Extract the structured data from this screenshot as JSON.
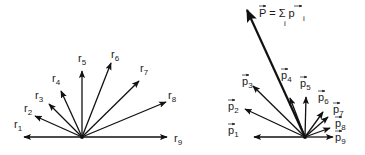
{
  "figure": {
    "left_panel": {
      "title": "position vectors",
      "origin": [
        82,
        137
      ],
      "vectors": [
        {
          "label": "r",
          "sub": "1",
          "tip": [
            24,
            137
          ],
          "lx": 14,
          "ly": 128
        },
        {
          "label": "r",
          "sub": "2",
          "tip": [
            35,
            116
          ],
          "lx": 24,
          "ly": 112
        },
        {
          "label": "r",
          "sub": "3",
          "tip": [
            49,
            104
          ],
          "lx": 35,
          "ly": 99
        },
        {
          "label": "r",
          "sub": "4",
          "tip": [
            61,
            91
          ],
          "lx": 52,
          "ly": 82
        },
        {
          "label": "r",
          "sub": "5",
          "tip": [
            82,
            71
          ],
          "lx": 78,
          "ly": 62
        },
        {
          "label": "r",
          "sub": "6",
          "tip": [
            111,
            63
          ],
          "lx": 111,
          "ly": 58
        },
        {
          "label": "r",
          "sub": "7",
          "tip": [
            139,
            81
          ],
          "lx": 140,
          "ly": 72
        },
        {
          "label": "r",
          "sub": "8",
          "tip": [
            166,
            102
          ],
          "lx": 168,
          "ly": 99
        },
        {
          "label": "r",
          "sub": "9",
          "tip": [
            167,
            137
          ],
          "lx": 174,
          "ly": 142
        }
      ]
    },
    "right_panel": {
      "title": "momentum vectors",
      "origin": [
        305,
        137
      ],
      "sum_label": "P = Σ p",
      "sum_index": "i",
      "sum_vector_tip": [
        247,
        10
      ],
      "vectors": [
        {
          "label": "p",
          "sub": "1",
          "tip": [
            254,
            137
          ],
          "lx": 228,
          "ly": 134
        },
        {
          "label": "p",
          "sub": "2",
          "tip": [
            245,
            109
          ],
          "lx": 228,
          "ly": 110
        },
        {
          "label": "p",
          "sub": "3",
          "tip": [
            253,
            86
          ],
          "lx": 242,
          "ly": 85
        },
        {
          "label": "p",
          "sub": "4",
          "tip": [
            290,
            98
          ],
          "lx": 281,
          "ly": 79
        },
        {
          "label": "p",
          "sub": "5",
          "tip": [
            306,
            97
          ],
          "lx": 300,
          "ly": 87
        },
        {
          "label": "p",
          "sub": "6",
          "tip": [
            323,
            112
          ],
          "lx": 318,
          "ly": 101
        },
        {
          "label": "p",
          "sub": "7",
          "tip": [
            328,
            117
          ],
          "lx": 333,
          "ly": 113
        },
        {
          "label": "p",
          "sub": "8",
          "tip": [
            330,
            128
          ],
          "lx": 335,
          "ly": 127
        },
        {
          "label": "p",
          "sub": "9",
          "tip": [
            333,
            137
          ],
          "lx": 335,
          "ly": 141
        }
      ]
    }
  }
}
